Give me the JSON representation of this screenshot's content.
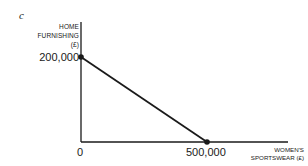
{
  "chart_data": {
    "type": "line",
    "title": "",
    "panel_label": "c",
    "xlabel": "WOMEN'S\nSPORTSWEAR (£)",
    "ylabel": "HOME\nFURNISHING\n(£)",
    "x": [
      0,
      500000
    ],
    "series": [
      {
        "name": "Production possibility frontier",
        "values": [
          200000,
          0
        ]
      }
    ],
    "points": [
      {
        "x": 0,
        "y": 200000,
        "marker": true
      },
      {
        "x": 500000,
        "y": 0,
        "marker": true
      }
    ],
    "x_ticks": [
      "0",
      "500,000"
    ],
    "y_ticks": [
      "200,000"
    ],
    "xlim": [
      0,
      500000
    ],
    "ylim": [
      0,
      200000
    ],
    "grid": false,
    "legend": "none"
  },
  "labels": {
    "panel": "c",
    "y_axis": "HOME\nFURNISHING\n(£)",
    "x_axis": "WOMEN'S\nSPORTSWEAR (£)",
    "y_tick_200000": "200,000",
    "x_tick_0": "0",
    "x_tick_500000": "500,000"
  },
  "colors": {
    "line": "#1a1a1a",
    "axis": "#1a1a1a",
    "background": "#ffffff"
  }
}
